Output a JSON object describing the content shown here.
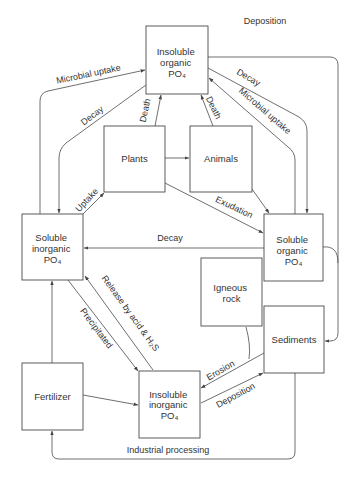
{
  "diagram": {
    "nodes": {
      "insoluble_organic": {
        "lines": [
          "Insoluble",
          "organic",
          "PO₄"
        ]
      },
      "plants": {
        "lines": [
          "Plants"
        ]
      },
      "animals": {
        "lines": [
          "Animals"
        ]
      },
      "soluble_inorganic": {
        "lines": [
          "Soluble",
          "inorganic",
          "PO₄"
        ]
      },
      "soluble_organic": {
        "lines": [
          "Soluble",
          "organic",
          "PO₄"
        ]
      },
      "igneous_rock": {
        "lines": [
          "Igneous",
          "rock"
        ]
      },
      "sediments": {
        "lines": [
          "Sediments"
        ]
      },
      "fertilizer": {
        "lines": [
          "Fertilizer"
        ]
      },
      "insoluble_inorganic": {
        "lines": [
          "Insoluble",
          "inorganic",
          "PO₄"
        ]
      }
    },
    "edges": {
      "deposition_top": {
        "from": "insoluble_organic",
        "to": "sediments",
        "label": "Deposition"
      },
      "microbial_uptake_left": {
        "from": "soluble_inorganic",
        "to": "insoluble_organic",
        "label": "Microbial uptake"
      },
      "decay_left": {
        "from": "insoluble_organic",
        "to": "soluble_inorganic",
        "label": "Decay"
      },
      "death_plants": {
        "from": "plants",
        "to": "insoluble_organic",
        "label": "Death"
      },
      "death_animals": {
        "from": "animals",
        "to": "insoluble_organic",
        "label": "Death"
      },
      "decay_right": {
        "from": "insoluble_organic",
        "to": "soluble_organic",
        "label": "Decay"
      },
      "microbial_uptake_right": {
        "from": "soluble_organic",
        "to": "insoluble_organic",
        "label": "Microbial uptake"
      },
      "uptake": {
        "from": "soluble_inorganic",
        "to": "plants",
        "label": "Uptake"
      },
      "plants_to_animals": {
        "from": "plants",
        "to": "animals",
        "label": ""
      },
      "exudation": {
        "from": "plants",
        "to": "soluble_organic",
        "label": "Exudation"
      },
      "animals_to_soluble_organic": {
        "from": "animals",
        "to": "soluble_organic",
        "label": ""
      },
      "decay_middle": {
        "from": "soluble_organic",
        "to": "soluble_inorganic",
        "label": "Decay"
      },
      "soluble_organic_to_sediments": {
        "from": "soluble_organic",
        "to": "sediments",
        "label": ""
      },
      "release": {
        "from": "insoluble_inorganic",
        "to": "soluble_inorganic",
        "label": "Release by acid & H₂S"
      },
      "precipitated": {
        "from": "soluble_inorganic",
        "to": "insoluble_inorganic",
        "label": "Precipitated"
      },
      "fertilizer_to_soluble_inorganic": {
        "from": "fertilizer",
        "to": "soluble_inorganic",
        "label": ""
      },
      "fertilizer_to_insoluble_inorganic": {
        "from": "fertilizer",
        "to": "insoluble_inorganic",
        "label": ""
      },
      "erosion": {
        "from": "igneous_rock",
        "to": "insoluble_inorganic",
        "label": "Erosion"
      },
      "deposition_bottom": {
        "from": "insoluble_inorganic",
        "to": "sediments",
        "label": "Deposition"
      },
      "industrial_processing": {
        "from": "sediments",
        "to": "fertilizer",
        "label": "Industrial processing"
      }
    },
    "colors": {
      "line": "#555555",
      "text": "#333333",
      "background": "#ffffff"
    }
  }
}
